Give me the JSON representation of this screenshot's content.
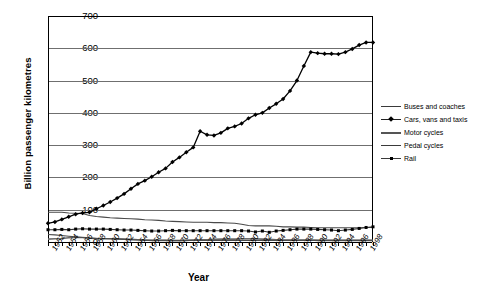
{
  "chart_data": {
    "type": "line",
    "title": "",
    "xlabel": "Year",
    "ylabel": "Billion passenger kilometres",
    "xlim": [
      1952,
      1999
    ],
    "ylim": [
      0,
      700
    ],
    "ytick_step": 100,
    "yticks": [
      0,
      100,
      200,
      300,
      400,
      500,
      600,
      700
    ],
    "xticks_labeled": [
      1952,
      1954,
      1956,
      1958,
      1960,
      1962,
      1964,
      1966,
      1968,
      1970,
      1972,
      1974,
      1976,
      1978,
      1980,
      1982,
      1984,
      1986,
      1988,
      1990,
      1992,
      1994,
      1996,
      1998
    ],
    "grid": "horizontal",
    "legend_position": "right",
    "x": [
      1952,
      1953,
      1954,
      1955,
      1956,
      1957,
      1958,
      1959,
      1960,
      1961,
      1962,
      1963,
      1964,
      1965,
      1966,
      1967,
      1968,
      1969,
      1970,
      1971,
      1972,
      1973,
      1974,
      1975,
      1976,
      1977,
      1978,
      1979,
      1980,
      1981,
      1982,
      1983,
      1984,
      1985,
      1986,
      1987,
      1988,
      1989,
      1990,
      1991,
      1992,
      1993,
      1994,
      1995,
      1996,
      1997,
      1998,
      1999
    ],
    "series": [
      {
        "name": "Buses and coaches",
        "color": "#4a4a4a",
        "marker": "none",
        "values": [
          92,
          92,
          92,
          90,
          89,
          88,
          82,
          79,
          77,
          75,
          74,
          73,
          72,
          71,
          69,
          68,
          67,
          65,
          64,
          63,
          62,
          61,
          61,
          61,
          60,
          60,
          59,
          58,
          55,
          51,
          50,
          50,
          50,
          49,
          47,
          47,
          46,
          46,
          45,
          44,
          44,
          44,
          44,
          44,
          44,
          44,
          45,
          45
        ]
      },
      {
        "name": "Cars, vans and taxis",
        "color": "#000000",
        "marker": "diamond",
        "values": [
          58,
          62,
          70,
          78,
          86,
          90,
          92,
          103,
          113,
          124,
          136,
          149,
          165,
          180,
          190,
          202,
          216,
          228,
          248,
          262,
          278,
          293,
          343,
          332,
          330,
          338,
          352,
          358,
          367,
          383,
          394,
          400,
          415,
          428,
          443,
          468,
          500,
          545,
          588,
          585,
          583,
          583,
          582,
          588,
          598,
          610,
          618,
          618
        ]
      },
      {
        "name": "Motor cycles",
        "color": "#6b6b6b",
        "marker": "none",
        "values": [
          9,
          10,
          11,
          13,
          14,
          14,
          12,
          11,
          10,
          10,
          10,
          9,
          8,
          7,
          6,
          5,
          5,
          5,
          4,
          4,
          5,
          6,
          7,
          7,
          8,
          9,
          9,
          9,
          10,
          10,
          10,
          9,
          8,
          7,
          6,
          6,
          6,
          6,
          6,
          5,
          5,
          5,
          5,
          5,
          5,
          5,
          5,
          5
        ]
      },
      {
        "name": "Pedal cycles",
        "color": "#4a4a4a",
        "marker": "none",
        "values": [
          23,
          22,
          20,
          18,
          16,
          14,
          12,
          11,
          11,
          10,
          9,
          8,
          7,
          6,
          5,
          5,
          5,
          5,
          5,
          5,
          5,
          5,
          5,
          5,
          5,
          5,
          5,
          5,
          5,
          5,
          5,
          5,
          5,
          5,
          5,
          5,
          5,
          5,
          5,
          5,
          5,
          5,
          5,
          5,
          5,
          5,
          5,
          5
        ]
      },
      {
        "name": "Rail",
        "color": "#333333",
        "marker": "square",
        "values": [
          38,
          38,
          39,
          38,
          40,
          41,
          40,
          40,
          40,
          39,
          38,
          37,
          37,
          36,
          35,
          34,
          34,
          35,
          36,
          35,
          35,
          35,
          35,
          35,
          35,
          35,
          35,
          35,
          35,
          34,
          31,
          34,
          30,
          34,
          36,
          38,
          40,
          40,
          40,
          39,
          38,
          37,
          35,
          37,
          39,
          42,
          45,
          47
        ]
      }
    ]
  },
  "axis": {
    "y_title": "Billion passenger kilometres",
    "x_title": "Year",
    "y_labels": [
      "700",
      "600",
      "500",
      "400",
      "300",
      "200",
      "100",
      "0"
    ]
  },
  "legend": {
    "items": [
      {
        "label": "Buses and coaches",
        "key": "line-thin"
      },
      {
        "label": "Cars, vans and taxis",
        "key": "line-diamond"
      },
      {
        "label": "Motor cycles",
        "key": "line-thick"
      },
      {
        "label": "Pedal cycles",
        "key": "line-thin"
      },
      {
        "label": "Rail",
        "key": "line-square"
      }
    ]
  }
}
